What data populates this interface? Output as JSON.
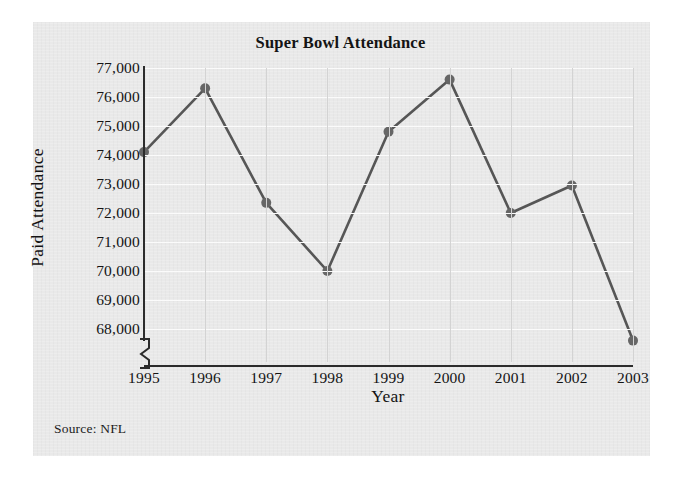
{
  "chart_data": {
    "type": "line",
    "title": "Super Bowl Attendance",
    "xlabel": "Year",
    "ylabel": "Paid Attendance",
    "source": "Source: NFL",
    "categories": [
      "1995",
      "1996",
      "1997",
      "1998",
      "1999",
      "2000",
      "2001",
      "2002",
      "2003"
    ],
    "values": [
      74100,
      76300,
      72350,
      70000,
      74800,
      76600,
      72000,
      72950,
      67600
    ],
    "series": [
      {
        "name": "Paid Attendance",
        "values": [
          74100,
          76300,
          72350,
          70000,
          74800,
          76600,
          72000,
          72950,
          67600
        ]
      }
    ],
    "ytick_labels": [
      "77,000",
      "76,000",
      "75,000",
      "74,000",
      "73,000",
      "72,000",
      "71,000",
      "70,000",
      "69,000",
      "68,000"
    ],
    "ytick_values": [
      77000,
      76000,
      75000,
      74000,
      73000,
      72000,
      71000,
      70000,
      69000,
      68000
    ],
    "ylim": [
      67200,
      77000
    ],
    "xlim": [
      "1995",
      "2003"
    ],
    "grid": true,
    "legend": "none",
    "axis_break": true,
    "colors": {
      "line": "#565656",
      "marker": "#666666",
      "axis": "#2b2b2b",
      "grid_horizontal": "#fbfbfb",
      "grid_vertical": "#d3d3d3",
      "panel_background": "#e9e9e9",
      "page_background": "#ffffff",
      "text": "#141414"
    }
  }
}
